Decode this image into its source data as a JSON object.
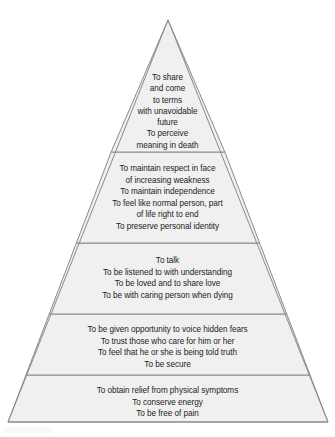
{
  "diagram": {
    "type": "pyramid",
    "orientation": "apex-top",
    "fill_color": "#f0f0f0",
    "stroke_color": "#8a8a8a",
    "text_color": "#1c1c1c",
    "background_color": "#ffffff",
    "apex": {
      "x": 168,
      "y": 20
    },
    "base_left": {
      "x": 8,
      "y": 422
    },
    "base_right": {
      "x": 328,
      "y": 422
    },
    "divider_y": [
      152,
      243,
      314,
      375
    ],
    "tier_count": 5,
    "tiers": [
      {
        "index": 0,
        "position": "top",
        "lines": [
          "To share",
          "and come",
          "to terms",
          "with unavoidable",
          "future",
          "To perceive",
          "meaning in death"
        ],
        "text": "To share\nand come\nto terms\nwith unavoidable\nfuture\nTo perceive\nmeaning in death"
      },
      {
        "index": 1,
        "position": "second",
        "lines": [
          "To maintain respect in face",
          "of increasing weakness",
          "To maintain independence",
          "To feel like normal person, part",
          "of life right to end",
          "To preserve personal identity"
        ],
        "text": "To maintain respect in face\nof increasing weakness\nTo maintain independence\nTo feel like normal person, part\nof life right to end\nTo preserve personal identity"
      },
      {
        "index": 2,
        "position": "middle",
        "lines": [
          "To talk",
          "To be listened to with understanding",
          "To be loved and to share love",
          "To be with caring person when dying"
        ],
        "text": "To talk\nTo be listened to with understanding\nTo be loved and to share love\nTo be with caring person when dying"
      },
      {
        "index": 3,
        "position": "fourth",
        "lines": [
          "To be given opportunity to voice hidden fears",
          "To trust those who care for him or her",
          "To feel that he or she is being told truth",
          "To be secure"
        ],
        "text": "To be given opportunity to voice hidden fears\nTo trust those who care for him or her\nTo feel that he or she is being told truth\nTo be secure"
      },
      {
        "index": 4,
        "position": "base",
        "lines": [
          "To obtain relief from physical symptoms",
          "To conserve energy",
          "To be free of pain"
        ],
        "text": "To obtain relief from physical symptoms\nTo conserve energy\nTo be free of pain"
      }
    ]
  }
}
